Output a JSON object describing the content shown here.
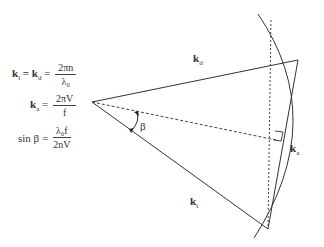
{
  "equations": [
    {
      "lhs": "k",
      "lhs_sub": "i",
      "mid": " = k",
      "mid_sub": "d",
      "eq": " =",
      "num": "2πn",
      "den": "λ₀"
    },
    {
      "lhs": "k",
      "lhs_sub": "a",
      "eq": " =",
      "num": "2πV",
      "den": "f"
    },
    {
      "lhs": "sin β",
      "eq": " =",
      "num": "λ₀f",
      "den": "2nV"
    }
  ],
  "labels": {
    "kd": {
      "base": "k",
      "sub": "d"
    },
    "ki": {
      "base": "k",
      "sub": "i"
    },
    "ka": {
      "base": "k",
      "sub": "a"
    },
    "beta": "β"
  },
  "colors": {
    "line": "#333333",
    "background": "#ffffff"
  }
}
